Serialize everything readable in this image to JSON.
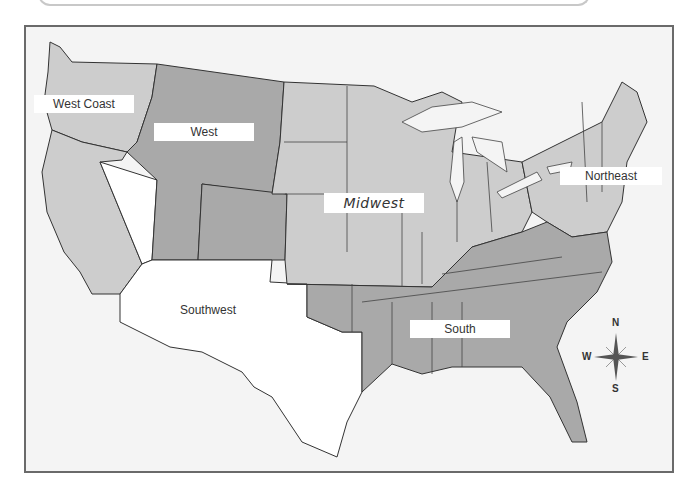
{
  "map": {
    "title": "United States Regions",
    "colors": {
      "background": "#f4f4f4",
      "frame_border": "#6a6a6a",
      "light_region": "#cdcdcd",
      "dark_region": "#a9a9a9",
      "white_region": "#ffffff",
      "border_line": "#333333",
      "label_bg": "#ffffff"
    },
    "regions": [
      {
        "name": "West Coast",
        "label": "West Coast",
        "shade": "light"
      },
      {
        "name": "West",
        "label": "West",
        "shade": "dark"
      },
      {
        "name": "Midwest",
        "label": "Midwest",
        "shade": "light"
      },
      {
        "name": "Northeast",
        "label": "Northeast",
        "shade": "light"
      },
      {
        "name": "Southwest",
        "label": "Southwest",
        "shade": "white"
      },
      {
        "name": "South",
        "label": "South",
        "shade": "dark"
      }
    ],
    "compass": {
      "icon": "compass-rose-icon",
      "n": "N",
      "s": "S",
      "e": "E",
      "w": "W"
    }
  }
}
